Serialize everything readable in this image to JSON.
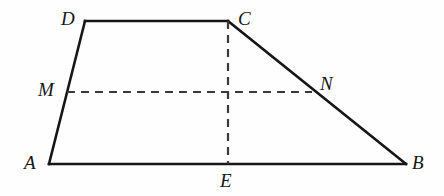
{
  "figure": {
    "canvas": {
      "width": 444,
      "height": 196
    },
    "colors": {
      "background": "#fefefe",
      "stroke": "#161616",
      "dashed_stroke": "#3a3a3a",
      "label": "#161616"
    },
    "stroke_width": 2.6,
    "dash_pattern": "8 6",
    "points": {
      "A": {
        "x": 49,
        "y": 164
      },
      "B": {
        "x": 406,
        "y": 164
      },
      "C": {
        "x": 228,
        "y": 21
      },
      "D": {
        "x": 85,
        "y": 21
      },
      "E": {
        "x": 228,
        "y": 164
      },
      "M": {
        "x": 67,
        "y": 92
      },
      "N": {
        "x": 312,
        "y": 92
      }
    },
    "solid_segments": [
      {
        "name": "segment-AB",
        "from": "A",
        "to": "B"
      },
      {
        "name": "segment-AD",
        "from": "A",
        "to": "D"
      },
      {
        "name": "segment-DC",
        "from": "D",
        "to": "C"
      },
      {
        "name": "segment-CB",
        "from": "C",
        "to": "B"
      }
    ],
    "dashed_segments": [
      {
        "name": "segment-MN",
        "from": "M",
        "to": "N"
      },
      {
        "name": "segment-CE",
        "from": "C",
        "to": "E"
      }
    ],
    "labels": [
      {
        "id": "A",
        "text": "A",
        "x": 24,
        "y": 153
      },
      {
        "id": "B",
        "text": "B",
        "x": 412,
        "y": 153
      },
      {
        "id": "C",
        "text": "C",
        "x": 238,
        "y": 9
      },
      {
        "id": "D",
        "text": "D",
        "x": 61,
        "y": 9
      },
      {
        "id": "E",
        "text": "E",
        "x": 220,
        "y": 171
      },
      {
        "id": "M",
        "text": "M",
        "x": 38,
        "y": 80
      },
      {
        "id": "N",
        "text": "N",
        "x": 320,
        "y": 74
      }
    ]
  }
}
